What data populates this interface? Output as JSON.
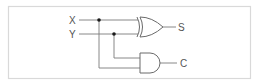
{
  "diagram": {
    "inputs": [
      {
        "label": "X"
      },
      {
        "label": "Y"
      }
    ],
    "outputs": [
      {
        "label": "S",
        "gate": "XOR"
      },
      {
        "label": "C",
        "gate": "AND"
      }
    ],
    "gates": [
      {
        "type": "XOR",
        "inputs": [
          "X",
          "Y"
        ],
        "output": "S"
      },
      {
        "type": "AND",
        "inputs": [
          "Y",
          "X"
        ],
        "output": "C"
      }
    ],
    "colors": {
      "border": "#d9d9d9",
      "wire": "#7a7a7a",
      "gate": "#6a6a6a",
      "junction": "#1a1a1a",
      "label": "#555555"
    }
  }
}
